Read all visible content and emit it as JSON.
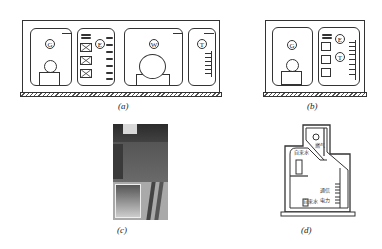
{
  "figure": {
    "panels": [
      {
        "id": "a",
        "caption": "(a)",
        "description": "Multi-compartment utility tunnel cross-section",
        "compartments": [
          {
            "symbol": "G",
            "meaning": "gas"
          },
          {
            "symbol": "E",
            "meaning": "electric power"
          },
          {
            "symbol": "W",
            "meaning": "water"
          },
          {
            "symbol": "T",
            "meaning": "telecom"
          }
        ]
      },
      {
        "id": "b",
        "caption": "(b)",
        "description": "Two-compartment utility tunnel cross-section",
        "compartments": [
          {
            "symbol": "G",
            "meaning": "gas"
          },
          {
            "symbol": "E",
            "meaning": "electric power"
          },
          {
            "symbol": "T",
            "meaning": "telecom"
          }
        ]
      },
      {
        "id": "c",
        "caption": "(c)",
        "description": "Photo of street and cable trench"
      },
      {
        "id": "d",
        "caption": "(d)",
        "description": "Special-shaped utility tunnel section",
        "labels": {
          "gas": "燃气",
          "tap_water_upper": "自来水",
          "telecom": "通信",
          "power": "电力",
          "tap_water_lower": "自来水"
        }
      }
    ]
  }
}
